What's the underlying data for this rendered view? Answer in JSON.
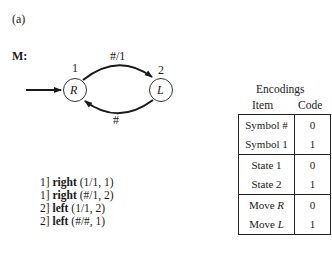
{
  "figure_label": "(a)",
  "machine_label": "M:",
  "states": [
    {
      "number": "1",
      "symbol": "R",
      "start": true
    },
    {
      "number": "2",
      "symbol": "L",
      "start": false
    }
  ],
  "transitions": [
    {
      "from": "1",
      "to": "2",
      "label": "#/1"
    },
    {
      "from": "2",
      "to": "1",
      "label": "#"
    }
  ],
  "instructions": [
    {
      "state": "1]",
      "dir": "right",
      "args": "(1/1, 1)"
    },
    {
      "state": "1]",
      "dir": "right",
      "args": "(#/1, 2)"
    },
    {
      "state": "2]",
      "dir": "left",
      "args": "(1/1, 2)"
    },
    {
      "state": "2]",
      "dir": "left",
      "args": "(#/#, 1)"
    }
  ],
  "encodings": {
    "title": "Encodings",
    "headers": [
      "Item",
      "Code"
    ],
    "rows": [
      {
        "item": "Symbol #",
        "code": "0"
      },
      {
        "item": "Symbol 1",
        "code": "1"
      },
      {
        "item": "State 1",
        "code": "0"
      },
      {
        "item": "State 2",
        "code": "1"
      },
      {
        "item_prefix": "Move ",
        "item_italic": "R",
        "code": "0"
      },
      {
        "item_prefix": "Move ",
        "item_italic": "L",
        "code": "1"
      }
    ]
  }
}
